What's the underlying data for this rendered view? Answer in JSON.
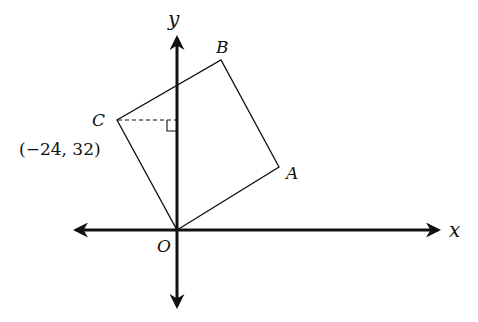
{
  "diagram": {
    "type": "coordinate-geometry",
    "axes": {
      "x_label": "x",
      "y_label": "y",
      "origin_label": "O"
    },
    "shape": {
      "kind": "square",
      "vertices": [
        {
          "name": "O",
          "label": "O"
        },
        {
          "name": "A",
          "label": "A"
        },
        {
          "name": "B",
          "label": "B"
        },
        {
          "name": "C",
          "label": "C",
          "coordinates": "(−24, 32)"
        }
      ]
    },
    "annotations": {
      "dashed_line": "horizontal dashed segment from C to the y-axis",
      "right_angle_marker": "right-angle marker where the dashed line meets the y-axis",
      "c_coordinates": "(−24, 32)"
    },
    "colors": {
      "stroke": "#111111",
      "background": "#ffffff"
    }
  }
}
